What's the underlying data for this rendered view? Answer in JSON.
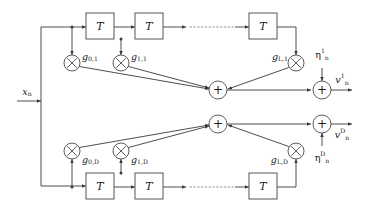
{
  "figure": {
    "kind": "block-diagram",
    "background_color": "#ffffff",
    "line_color": "#3a3a3a",
    "dotted_line_color": "#9a9a9a",
    "box_stroke_color": "#555555"
  },
  "input": {
    "label_base": "x",
    "label_sub": "n"
  },
  "top_branch": {
    "delay_blocks": [
      {
        "label": "T"
      },
      {
        "label": "T"
      },
      {
        "label": "T"
      }
    ],
    "ellipsis": "········",
    "multipliers": [
      {
        "glyph": "×",
        "gain_base": "g",
        "gain_sub": "0,1"
      },
      {
        "glyph": "×",
        "gain_base": "g",
        "gain_sub": "1,1"
      },
      {
        "glyph": "×",
        "gain_base": "g",
        "gain_sub": "L,1"
      }
    ],
    "summer": {
      "glyph": "+"
    },
    "output_summer": {
      "glyph": "+"
    },
    "noise": {
      "base": "η",
      "sub": "n",
      "sup": "1"
    },
    "output": {
      "base": "v",
      "sub": "n",
      "sup": "1"
    }
  },
  "bottom_branch": {
    "delay_blocks": [
      {
        "label": "T"
      },
      {
        "label": "T"
      },
      {
        "label": "T"
      }
    ],
    "ellipsis": "········",
    "multipliers": [
      {
        "glyph": "×",
        "gain_base": "g",
        "gain_sub": "0,D"
      },
      {
        "glyph": "×",
        "gain_base": "g",
        "gain_sub": "1,D"
      },
      {
        "glyph": "×",
        "gain_base": "g",
        "gain_sub": "L,D"
      }
    ],
    "summer": {
      "glyph": "+"
    },
    "output_summer": {
      "glyph": "+"
    },
    "noise": {
      "base": "η",
      "sub": "n",
      "sup": "D"
    },
    "output": {
      "base": "v",
      "sub": "n",
      "sup": "D"
    }
  }
}
